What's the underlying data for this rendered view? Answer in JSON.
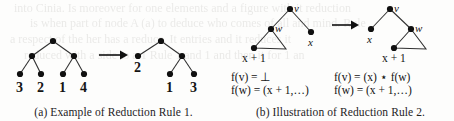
{
  "figure": {
    "background_color": "#fdfdfc",
    "ink_color": "#141414",
    "bleed_lines": [
      "into Cinia. Is moreover for one elements and a figure with it reduction",
      "is when part of node A (a) to deduce who comes of all and mind. Rule",
      "a respect of the her has a reduce. It entries and it reduces it",
      "reduced with a side to a 1 Rule 1 and 1 and then it for 1 an"
    ]
  },
  "panel_a": {
    "caption": "(a) Example of Reduction Rule 1.",
    "arrow": "→",
    "left_tree": {
      "name": "binary-tree-before",
      "nodes": [
        {
          "id": "root",
          "x": 53,
          "y": 41
        },
        {
          "id": "n-left",
          "x": 32,
          "y": 56
        },
        {
          "id": "n-right",
          "x": 74,
          "y": 56
        },
        {
          "id": "leaf-1",
          "x": 20,
          "y": 74
        },
        {
          "id": "leaf-2",
          "x": 41,
          "y": 74
        },
        {
          "id": "leaf-3",
          "x": 63,
          "y": 74
        },
        {
          "id": "leaf-4",
          "x": 84,
          "y": 74
        }
      ],
      "edges": [
        [
          "root",
          "n-left"
        ],
        [
          "root",
          "n-right"
        ],
        [
          "n-left",
          "leaf-1"
        ],
        [
          "n-left",
          "leaf-2"
        ],
        [
          "n-right",
          "leaf-3"
        ],
        [
          "n-right",
          "leaf-4"
        ]
      ],
      "leaf_labels": [
        {
          "text": "3",
          "x": 20,
          "y": 88
        },
        {
          "text": "2",
          "x": 41,
          "y": 88
        },
        {
          "text": "1",
          "x": 63,
          "y": 88
        },
        {
          "text": "4",
          "x": 84,
          "y": 88
        }
      ]
    },
    "right_tree": {
      "name": "binary-tree-after",
      "nodes": [
        {
          "id": "root",
          "x": 161,
          "y": 41
        },
        {
          "id": "n-left",
          "x": 138,
          "y": 56
        },
        {
          "id": "n-right",
          "x": 182,
          "y": 56
        },
        {
          "id": "leaf-1",
          "x": 170,
          "y": 74
        },
        {
          "id": "leaf-3",
          "x": 194,
          "y": 74
        }
      ],
      "edges": [
        [
          "root",
          "n-left"
        ],
        [
          "root",
          "n-right"
        ],
        [
          "n-right",
          "leaf-1"
        ],
        [
          "n-right",
          "leaf-3"
        ]
      ],
      "leaf_labels": [
        {
          "text": "2",
          "x": 138,
          "y": 70
        },
        {
          "text": "1",
          "x": 170,
          "y": 88
        },
        {
          "text": "3",
          "x": 194,
          "y": 88
        }
      ]
    }
  },
  "panel_b": {
    "caption": "(b) Illustration of Reduction Rule 2.",
    "arrow": "→",
    "left_tree": {
      "name": "rule2-tree-before",
      "nodes": [
        {
          "id": "v",
          "x": 63,
          "y": 9,
          "label": "v"
        },
        {
          "id": "w",
          "x": 44,
          "y": 29,
          "label": "w"
        },
        {
          "id": "x",
          "x": 84,
          "y": 32,
          "label": "x"
        },
        {
          "id": "t-left",
          "x": 27,
          "y": 48,
          "label": ""
        }
      ],
      "edges": [
        [
          "v",
          "w"
        ],
        [
          "v",
          "x"
        ]
      ],
      "subtree_triangle": {
        "apex_x": 44,
        "apex_y": 29,
        "left_x": 27,
        "left_y": 48,
        "right_x": 59,
        "right_y": 49
      },
      "subtree_label": "x + 1"
    },
    "right_tree": {
      "name": "rule2-tree-after",
      "nodes": [
        {
          "id": "v",
          "x": 163,
          "y": 9,
          "label": "v"
        },
        {
          "id": "x",
          "x": 144,
          "y": 29,
          "label": "x"
        },
        {
          "id": "w",
          "x": 184,
          "y": 29,
          "label": "w"
        },
        {
          "id": "t-left",
          "x": 167,
          "y": 48,
          "label": ""
        }
      ],
      "edges": [
        [
          "v",
          "x"
        ],
        [
          "v",
          "w"
        ]
      ],
      "subtree_triangle": {
        "apex_x": 184,
        "apex_y": 29,
        "left_x": 167,
        "left_y": 48,
        "right_x": 199,
        "right_y": 49
      },
      "subtree_label": "x + 1"
    },
    "equations": {
      "left_fv": "f(v) = ⊥",
      "left_fw": "f(w) = (x + 1,…)",
      "right_fv": "f(v) = (x) ⋆ f(w)",
      "right_fw": "f(w) = (x + 1,…)"
    }
  }
}
